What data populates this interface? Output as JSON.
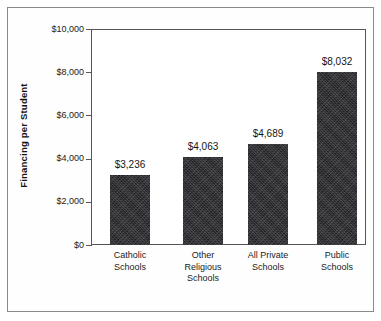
{
  "chart_data": {
    "type": "bar",
    "title": "",
    "subtitle": "",
    "xlabel": "",
    "ylabel": "Financing per Student",
    "categories": [
      "Catholic Schools",
      "Other Religious Schools",
      "All Private Schools",
      "Public Schools"
    ],
    "category_lines": [
      [
        "Catholic",
        "Schools"
      ],
      [
        "Other",
        "Religious",
        "Schools"
      ],
      [
        "All Private",
        "Schools"
      ],
      [
        "Public",
        "Schools"
      ]
    ],
    "values": [
      3236,
      4063,
      4689,
      8032
    ],
    "value_labels": [
      "$3,236",
      "$4,063",
      "$4,689",
      "$8,032"
    ],
    "ylim": [
      0,
      10000
    ],
    "ytick_values": [
      0,
      2000,
      4000,
      6000,
      8000,
      10000
    ],
    "ytick_labels": [
      "$0",
      "$2,000",
      "$4,000",
      "$6,000",
      "$8,000",
      "$10,000"
    ],
    "grid": false,
    "legend": null,
    "legend_position": "none",
    "bar_color": "#222226",
    "axis_color": "#55555a",
    "background_color": "#ffffff",
    "border_color": "#8a8a8a"
  }
}
